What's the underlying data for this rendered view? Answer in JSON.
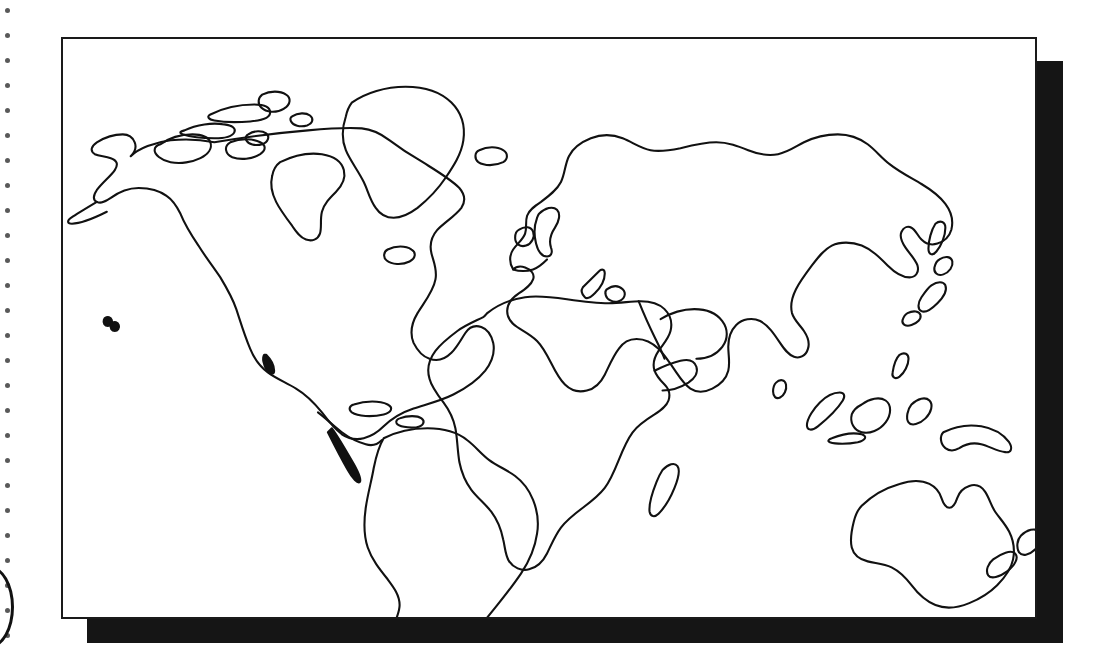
{
  "page": {
    "background_color": "#ffffff",
    "width": 1101,
    "height": 664,
    "media_type": "scanned worksheet page"
  },
  "binding": {
    "name": "spiral-binding-holes",
    "side": "left",
    "hole_count": 26,
    "hole_color": "#2a2a2a",
    "first_hole_y": 8,
    "hole_spacing": 25,
    "hole_x": 5,
    "hole_size": 5
  },
  "corner_mark": {
    "name": "partial-ring-mark",
    "description": "partial oval outline cropped by the left page edge",
    "color": "#111111"
  },
  "map_frame": {
    "name": "map-border",
    "border_color": "#1a1a1a",
    "fill_color": "#ffffff",
    "left": 61,
    "top": 37,
    "width": 976,
    "height": 582,
    "border_width": 2
  },
  "map_shadow": {
    "name": "map-drop-shadow",
    "color": "#151515",
    "offset_x": 26,
    "offset_y": 24
  },
  "map": {
    "name": "world-outline-map",
    "projection": "equirectangular-style outline",
    "line_color": "#111111",
    "line_width": 2.1,
    "fill": "none",
    "antarctica_shown": false,
    "graticule_shown": false,
    "labels_shown": false,
    "features": [
      {
        "id": "north-america",
        "label": "North America",
        "type": "continent"
      },
      {
        "id": "greenland",
        "label": "Greenland",
        "type": "island"
      },
      {
        "id": "canadian-arctic-islands",
        "label": "Canadian Arctic Archipelago",
        "type": "island-group"
      },
      {
        "id": "baffin-island",
        "label": "Baffin Island",
        "type": "island"
      },
      {
        "id": "iceland",
        "label": "Iceland",
        "type": "island"
      },
      {
        "id": "newfoundland",
        "label": "Newfoundland",
        "type": "island"
      },
      {
        "id": "hawaii",
        "label": "Hawaii",
        "type": "island-group"
      },
      {
        "id": "caribbean-cuba",
        "label": "Cuba",
        "type": "island"
      },
      {
        "id": "caribbean-hispaniola",
        "label": "Hispaniola",
        "type": "island"
      },
      {
        "id": "south-america",
        "label": "South America",
        "type": "continent"
      },
      {
        "id": "eurasia",
        "label": "Eurasia",
        "type": "continent"
      },
      {
        "id": "british-isles",
        "label": "British Isles",
        "type": "island-group"
      },
      {
        "id": "ireland",
        "label": "Ireland",
        "type": "island"
      },
      {
        "id": "africa",
        "label": "Africa",
        "type": "continent"
      },
      {
        "id": "madagascar",
        "label": "Madagascar",
        "type": "island"
      },
      {
        "id": "sri-lanka",
        "label": "Sri Lanka",
        "type": "island"
      },
      {
        "id": "japan",
        "label": "Japan",
        "type": "island-group"
      },
      {
        "id": "korea-sakhalin",
        "label": "Sakhalin",
        "type": "island"
      },
      {
        "id": "borneo",
        "label": "Borneo",
        "type": "island"
      },
      {
        "id": "sumatra",
        "label": "Sumatra",
        "type": "island"
      },
      {
        "id": "sulawesi",
        "label": "Sulawesi",
        "type": "island"
      },
      {
        "id": "new-guinea",
        "label": "New Guinea",
        "type": "island"
      },
      {
        "id": "australia",
        "label": "Australia",
        "type": "continent"
      },
      {
        "id": "new-zealand",
        "label": "New Zealand",
        "type": "island-group"
      },
      {
        "id": "philippines",
        "label": "Philippines",
        "type": "island-group"
      }
    ]
  }
}
